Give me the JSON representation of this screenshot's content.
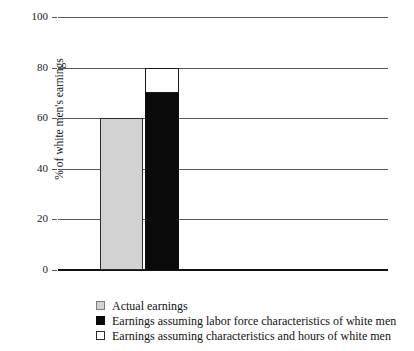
{
  "chart_data": {
    "type": "bar",
    "title": "",
    "subtitle": "",
    "xlabel": "",
    "ylabel": "% of white men's earnings",
    "ylim": [
      0,
      100
    ],
    "yticks": [
      0,
      20,
      40,
      60,
      80,
      100
    ],
    "ytick_labels": [
      "0",
      "20",
      "40",
      "60",
      "80",
      "100"
    ],
    "grid": true,
    "legend_position": "bottom-left",
    "categories": [
      ""
    ],
    "series": [
      {
        "name": "Actual earnings",
        "swatch": "gray",
        "color": "#d2d2d2",
        "values": [
          60
        ]
      },
      {
        "name": "Earnings assuming labor force characteristics of white men",
        "swatch": "black",
        "color": "#0a0a0a",
        "values": [
          70
        ]
      },
      {
        "name": "Earnings assuming characteristics and hours of white men",
        "swatch": "white",
        "color": "#ffffff",
        "values": [
          80
        ]
      }
    ],
    "bars": [
      {
        "name": "actual-earnings-bar",
        "segments": [
          {
            "label": "Actual earnings",
            "from": 0,
            "to": 60,
            "style": "gray"
          }
        ]
      },
      {
        "name": "adjusted-earnings-bar",
        "segments": [
          {
            "label": "Earnings assuming labor force characteristics of white men",
            "from": 0,
            "to": 70,
            "style": "black"
          },
          {
            "label": "Earnings assuming characteristics and hours of white men",
            "from": 70,
            "to": 80,
            "style": "white"
          }
        ]
      }
    ]
  },
  "axis": {
    "y_title": "% of white men's earnings",
    "ticks": [
      {
        "value": 100,
        "label": "100"
      },
      {
        "value": 80,
        "label": "80"
      },
      {
        "value": 60,
        "label": "60"
      },
      {
        "value": 40,
        "label": "40"
      },
      {
        "value": 20,
        "label": "20"
      },
      {
        "value": 0,
        "label": "0"
      }
    ]
  },
  "legend": {
    "items": [
      {
        "swatch": "gray",
        "label": "Actual earnings"
      },
      {
        "swatch": "black",
        "label": "Earnings assuming labor force characteristics of white men"
      },
      {
        "swatch": "white",
        "label": "Earnings assuming characteristics and hours of white men"
      }
    ]
  },
  "colors": {
    "gray_fill": "#d2d2d2",
    "black_fill": "#0a0a0a",
    "white_fill": "#ffffff",
    "gridline": "#5a5a5a",
    "baseline": "#111111",
    "text": "#111111"
  }
}
